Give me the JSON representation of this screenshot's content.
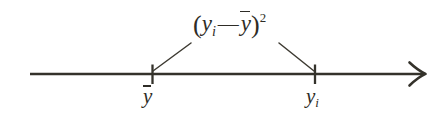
{
  "figure": {
    "background_color": "#ffffff",
    "ink_color": "#2e2c26"
  },
  "expression": {
    "full_text": "(y_i - ȳ)²",
    "open_paren": "(",
    "term1_var": "y",
    "term1_sub": "i",
    "operator": "—",
    "term2_var": "y",
    "close_paren": ")",
    "exponent": "2"
  },
  "axis": {
    "type": "number-line",
    "arrow_direction": "right",
    "line_start_x": 30,
    "line_end_x": 425,
    "line_y": 74
  },
  "ticks": [
    {
      "id": "mean",
      "label_var": "y",
      "label_overbar": true,
      "label_text": "ȳ",
      "x": 152
    },
    {
      "id": "observation",
      "label_var": "y",
      "label_sub": "i",
      "label_text": "y_i",
      "x": 315
    }
  ],
  "leaders": [
    {
      "id": "left-leader",
      "from_x": 153,
      "from_y": 71,
      "to_x": 191,
      "to_y": 43
    },
    {
      "id": "right-leader",
      "from_x": 314,
      "from_y": 71,
      "to_x": 279,
      "to_y": 43
    }
  ]
}
